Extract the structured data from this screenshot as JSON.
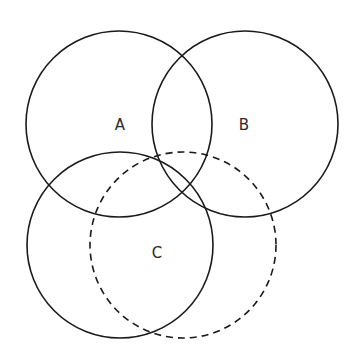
{
  "diagram": {
    "type": "venn",
    "background": "#ffffff",
    "stroke_color": "#1a1a1a",
    "sets": [
      {
        "label": "A",
        "style": "solid",
        "cx": 119,
        "cy": 124,
        "r": 93,
        "label_x": 120,
        "label_y": 125
      },
      {
        "label": "B",
        "style": "solid",
        "cx": 245,
        "cy": 124,
        "r": 93,
        "label_x": 244,
        "label_y": 125
      },
      {
        "label": "",
        "style": "solid",
        "cx": 120,
        "cy": 245,
        "r": 93
      },
      {
        "label": "C",
        "style": "dashed",
        "cx": 183,
        "cy": 245,
        "r": 93,
        "label_x": 157,
        "label_y": 253
      }
    ]
  }
}
